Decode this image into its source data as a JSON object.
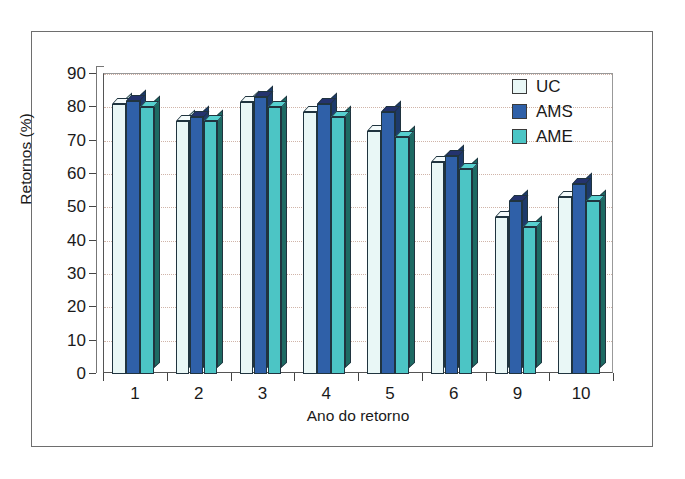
{
  "chart_data": {
    "type": "bar",
    "title": "",
    "xlabel": "Ano do retorno",
    "ylabel": "Retornos (%)",
    "categories": [
      "1",
      "2",
      "3",
      "4",
      "5",
      "6",
      "9",
      "10"
    ],
    "ylim": [
      0,
      90
    ],
    "yticks": [
      0,
      10,
      20,
      30,
      40,
      50,
      60,
      70,
      80,
      90
    ],
    "grid": true,
    "legend_position": "top-right",
    "series": [
      {
        "name": "UC",
        "color": "#e9f7f6",
        "values": [
          81,
          76,
          81.5,
          78.5,
          73,
          63.5,
          47,
          53
        ]
      },
      {
        "name": "AMS",
        "color": "#2f60a8",
        "values": [
          82,
          77,
          83,
          81,
          78.5,
          65.5,
          52,
          57
        ]
      },
      {
        "name": "AME",
        "color": "#4cc5c5",
        "values": [
          80,
          76,
          80,
          77,
          71,
          61.5,
          44,
          52
        ]
      }
    ]
  },
  "legend": {
    "items": [
      {
        "label": "UC"
      },
      {
        "label": "AMS"
      },
      {
        "label": "AME"
      }
    ]
  },
  "axes": {
    "y_label": "Retornos (%)",
    "x_label": "Ano do retorno",
    "y_tick_labels": [
      "0",
      "10",
      "20",
      "30",
      "40",
      "50",
      "60",
      "70",
      "80",
      "90"
    ],
    "x_tick_labels": [
      "1",
      "2",
      "3",
      "4",
      "5",
      "6",
      "9",
      "10"
    ]
  },
  "colors": {
    "uc_face": "#e9f7f6",
    "uc_top": "#f4fbfb",
    "uc_side": "#b9d6d4",
    "ams_face": "#2f60a8",
    "ams_top": "#24336e",
    "ams_side": "#1d3a6b",
    "ame_face": "#4cc5c5",
    "ame_top": "#56d0cf",
    "ame_side": "#1d6a63",
    "grid": "#c8a89a",
    "axis": "#444444",
    "text": "#1a1a1a",
    "frame": "#6e6e6e"
  }
}
